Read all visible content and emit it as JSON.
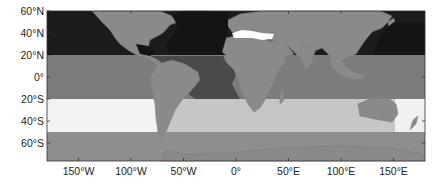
{
  "map": {
    "projection": "equirectangular",
    "lon_range": [
      -180,
      180
    ],
    "lat_range": [
      -75,
      62
    ],
    "y_axis": {
      "ticks": [
        {
          "lat": 60,
          "label": "60°N"
        },
        {
          "lat": 40,
          "label": "40°N"
        },
        {
          "lat": 20,
          "label": "20°N"
        },
        {
          "lat": 0,
          "label": "0°"
        },
        {
          "lat": -20,
          "label": "20°S"
        },
        {
          "lat": -40,
          "label": "40°S"
        },
        {
          "lat": -60,
          "label": "60°S"
        }
      ]
    },
    "x_axis": {
      "ticks": [
        {
          "lon": -150,
          "label": "150°W"
        },
        {
          "lon": -100,
          "label": "100°W"
        },
        {
          "lon": -50,
          "label": "50°W"
        },
        {
          "lon": 0,
          "label": "0°"
        },
        {
          "lon": 50,
          "label": "50°E"
        },
        {
          "lon": 100,
          "label": "100°E"
        },
        {
          "lon": 150,
          "label": "150°E"
        }
      ]
    },
    "regions": [
      {
        "name": "north-pacific-atlantic",
        "lat_from": 20,
        "lat_to": 62,
        "color": "#1c1c1c"
      },
      {
        "name": "tropical-band",
        "lat_from": -20,
        "lat_to": 20,
        "color": "#7c7c7c"
      },
      {
        "name": "tropical-atlantic-east",
        "lat_from": -20,
        "lat_to": 20,
        "color": "#4a4a4a"
      },
      {
        "name": "south-subtropical-pacific",
        "lat_from": -50,
        "lat_to": -20,
        "color": "#f2f2f2"
      },
      {
        "name": "south-subtropical-atlantic-indian",
        "lat_from": -50,
        "lat_to": -20,
        "color": "#c6c6c6"
      },
      {
        "name": "southern-ocean",
        "lat_from": -75,
        "lat_to": -50,
        "color": "#8e8e8e"
      },
      {
        "name": "mediterranean",
        "color": "#ffffff"
      }
    ],
    "land_color": "#8a8a8a",
    "frame_color": "#333333"
  }
}
